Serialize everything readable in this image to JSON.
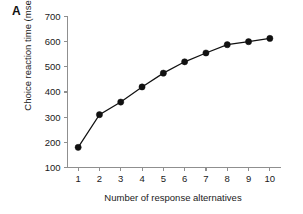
{
  "panel": {
    "label": "A"
  },
  "chart_data": {
    "type": "line",
    "title": "",
    "xlabel": "Number of response alternatives",
    "ylabel": "Choice reaction time (msec)",
    "x": [
      1,
      2,
      3,
      4,
      5,
      6,
      7,
      8,
      9,
      10
    ],
    "values": [
      180,
      310,
      360,
      420,
      475,
      520,
      555,
      588,
      600,
      613
    ],
    "series": [
      {
        "name": "Choice reaction time",
        "values": [
          180,
          310,
          360,
          420,
          475,
          520,
          555,
          588,
          600,
          613
        ]
      }
    ],
    "xlim": [
      1,
      10
    ],
    "ylim": [
      100,
      700
    ],
    "xticks": [
      "1",
      "2",
      "3",
      "4",
      "5",
      "6",
      "7",
      "8",
      "9",
      "10"
    ],
    "yticks": [
      "100",
      "200",
      "300",
      "400",
      "500",
      "600",
      "700"
    ],
    "grid": false,
    "legend": false,
    "marker": "filled-circle",
    "line_color": "#111111",
    "marker_color": "#111111",
    "axis_color": "#8f8f8f"
  }
}
